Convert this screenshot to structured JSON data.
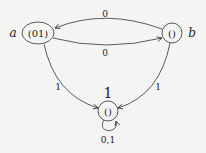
{
  "diagram": {
    "type": "state-machine",
    "states": [
      {
        "id": "a",
        "name": "a",
        "content": "(01)"
      },
      {
        "id": "b",
        "name": "b",
        "content": "()"
      },
      {
        "id": "c",
        "name": "1",
        "content": "()"
      }
    ],
    "transitions": [
      {
        "from": "b",
        "to": "a",
        "label": "0"
      },
      {
        "from": "a",
        "to": "b",
        "label": "0"
      },
      {
        "from": "a",
        "to": "c",
        "label": "1"
      },
      {
        "from": "b",
        "to": "c",
        "label": "1"
      },
      {
        "from": "c",
        "to": "c",
        "label": "0,1"
      }
    ]
  }
}
